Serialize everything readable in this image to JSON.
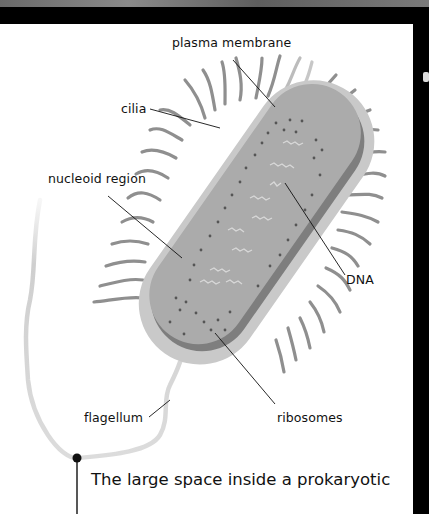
{
  "diagram": {
    "labels": {
      "plasma_membrane": "plasma membrane",
      "cilia": "cilia",
      "nucleoid_region": "nucleoid region",
      "dna": "DNA",
      "flagellum": "flagellum",
      "ribosomes": "ribosomes"
    },
    "caption": "The large space inside a prokaryotic",
    "colors": {
      "background": "#ffffff",
      "frame": "#000000",
      "cell_outer": "#c8c8c8",
      "cell_inner": "#a9a9a9",
      "membrane_band": "#7d7d7d",
      "cilia": "#8f8f8f",
      "flagellum": "#d3d3d3",
      "leader_lines": "#111111"
    }
  }
}
